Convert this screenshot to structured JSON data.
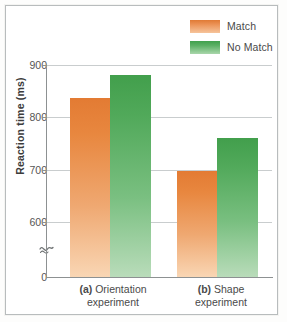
{
  "chart_data": {
    "type": "bar",
    "title": "",
    "subtitle": "",
    "xlabel": "",
    "ylabel": "Reaction time (ms)",
    "categories": [
      "(a) Orientation experiment",
      "(b) Shape experiment"
    ],
    "category_lines": [
      {
        "prefix": "(a)",
        "rest": " Orientation",
        "second_line": "experiment"
      },
      {
        "prefix": "(b)",
        "rest": " Shape",
        "second_line": "experiment"
      }
    ],
    "series": [
      {
        "name": "Match",
        "color": "#e8823c",
        "values": [
          837,
          697
        ]
      },
      {
        "name": "No Match",
        "color": "#4ca556",
        "values": [
          880,
          760
        ]
      }
    ],
    "ylim": [
      0,
      900
    ],
    "y_display_min": 570,
    "yticks": [
      0,
      600,
      700,
      800,
      900
    ],
    "ytick_labels": [
      "0",
      "600",
      "700",
      "800",
      "900"
    ],
    "gridlines": [
      600,
      700,
      800,
      900
    ],
    "grid": true,
    "axis_break": true,
    "axis_break_value": 300,
    "legend_position": "top-right",
    "legend": [
      "Match",
      "No Match"
    ]
  },
  "legend": {
    "items": [
      {
        "label": "Match",
        "swatch": "match-swatch"
      },
      {
        "label": "No Match",
        "swatch": "no-match-swatch"
      }
    ]
  },
  "axes": {
    "y_title": "Reaction time (ms)",
    "tick_900": "900",
    "tick_800": "800",
    "tick_700": "700",
    "tick_600": "600",
    "tick_0": "0"
  },
  "categories": {
    "a_prefix": "(a)",
    "a_name": " Orientation",
    "a_line2": "experiment",
    "b_prefix": "(b)",
    "b_name": " Shape",
    "b_line2": "experiment"
  },
  "colors": {
    "match": "#e8823c",
    "no_match": "#4ca556",
    "grid": "#c9cdce",
    "axis": "#8d9192",
    "frame": "#b8bcbd",
    "text": "#4a4a4a"
  }
}
